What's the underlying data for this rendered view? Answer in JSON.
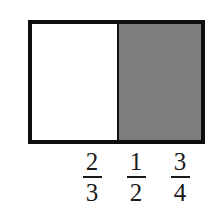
{
  "figure": {
    "background_color": "#ffffff",
    "bar": {
      "border_color": "#0d0d0d",
      "divider_color": "#121212",
      "segments": [
        {
          "name": "unshaded",
          "label": "",
          "fill_color": "#ffffff",
          "width_percent": 51.5
        },
        {
          "name": "shaded",
          "label": "",
          "fill_color": "#7d7d7d",
          "width_percent": 48.5
        }
      ]
    },
    "fraction_choices": [
      {
        "numerator": "2",
        "denominator": "3",
        "text": "2/3",
        "x_center": 92
      },
      {
        "numerator": "1",
        "denominator": "2",
        "text": "1/2",
        "x_center": 136
      },
      {
        "numerator": "3",
        "denominator": "4",
        "text": "3/4",
        "x_center": 180
      }
    ]
  }
}
